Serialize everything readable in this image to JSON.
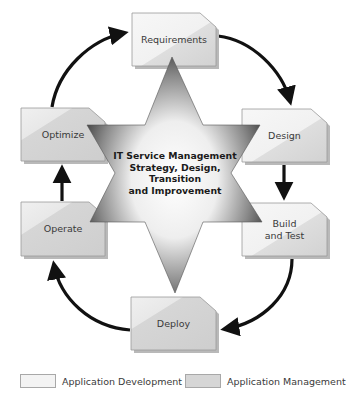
{
  "diagram": {
    "center": {
      "lines": [
        "IT Service Management",
        "Strategy, Design,",
        "Transition",
        "and Improvement"
      ]
    },
    "stages": [
      {
        "id": "requirements",
        "label_lines": [
          "Requirements"
        ],
        "category": "Application Development"
      },
      {
        "id": "design",
        "label_lines": [
          "Design"
        ],
        "category": "Application Development"
      },
      {
        "id": "build-and-test",
        "label_lines": [
          "Build",
          "and Test"
        ],
        "category": "Application Development"
      },
      {
        "id": "deploy",
        "label_lines": [
          "Deploy"
        ],
        "category": "Application Management"
      },
      {
        "id": "operate",
        "label_lines": [
          "Operate"
        ],
        "category": "Application Management"
      },
      {
        "id": "optimize",
        "label_lines": [
          "Optimize"
        ],
        "category": "Application Management"
      }
    ],
    "flow": [
      "Requirements",
      "Design",
      "Build and Test",
      "Deploy",
      "Operate",
      "Optimize",
      "Requirements"
    ],
    "legend": [
      {
        "label": "Application Development",
        "color": "#f3f3f3"
      },
      {
        "label": "Application Management",
        "color": "#d6d6d6"
      }
    ],
    "colors": {
      "arrow": "#111111",
      "box_border": "#9a9a9a",
      "box_shadow": "#b9b9b9",
      "star_dark": "#4a4a4a",
      "star_light": "#ffffff"
    }
  }
}
